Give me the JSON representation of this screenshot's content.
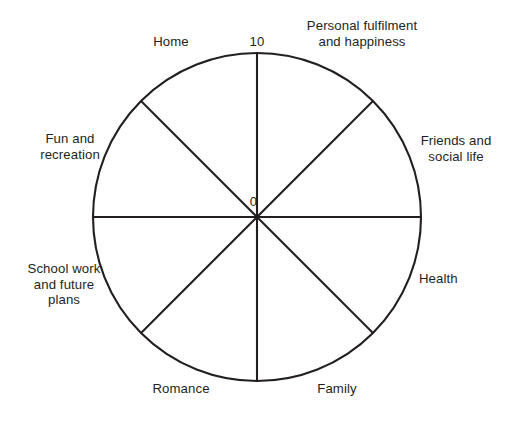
{
  "diagram": {
    "type": "wheel-of-life",
    "scale": {
      "center_label": "0",
      "rim_label": "10",
      "min": 0,
      "max": 10
    },
    "geometry": {
      "center_x": 257,
      "center_y": 217,
      "radius": 164,
      "segment_count": 8,
      "spoke_angles_deg": [
        0,
        45,
        90,
        135,
        180,
        225,
        270,
        315
      ]
    },
    "colors": {
      "background": "#ffffff",
      "stroke": "#231f20",
      "text": "#231f20"
    },
    "segments": [
      {
        "id": "personal-fulfilment",
        "label": "Personal fulfilment\nand happiness",
        "angle_deg": 67.5
      },
      {
        "id": "friends-social-life",
        "label": "Friends and\nsocial life",
        "angle_deg": 22.5
      },
      {
        "id": "health",
        "label": "Health",
        "angle_deg": 337.5
      },
      {
        "id": "family",
        "label": "Family",
        "angle_deg": 292.5
      },
      {
        "id": "romance",
        "label": "Romance",
        "angle_deg": 247.5
      },
      {
        "id": "school-work",
        "label": "School work\nand future\nplans",
        "angle_deg": 202.5
      },
      {
        "id": "fun-recreation",
        "label": "Fun and\nrecreation",
        "angle_deg": 157.5
      },
      {
        "id": "home",
        "label": "Home",
        "angle_deg": 112.5
      }
    ]
  }
}
